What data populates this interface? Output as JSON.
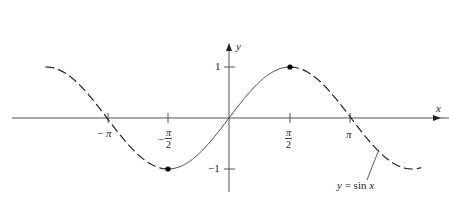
{
  "chart_data": {
    "type": "line",
    "title": "",
    "function": "y = sin x",
    "xlabel": "x",
    "ylabel": "y",
    "x_ticks": [
      {
        "value": -3.14159,
        "label": "−π"
      },
      {
        "value": -1.5708,
        "label": "−π/2"
      },
      {
        "value": 1.5708,
        "label": "π/2"
      },
      {
        "value": 3.14159,
        "label": "π"
      }
    ],
    "y_ticks": [
      {
        "value": 1,
        "label": "1"
      },
      {
        "value": -1,
        "label": "−1"
      }
    ],
    "xlim": [
      -5.9,
      6.2
    ],
    "ylim": [
      -1.6,
      1.6
    ],
    "solid_range": [
      -1.5708,
      1.5708
    ],
    "dashed_ranges": [
      [
        -5.0,
        -1.5708
      ],
      [
        1.5708,
        5.0
      ]
    ],
    "marked_points": [
      {
        "x": -1.5708,
        "y": -1
      },
      {
        "x": 1.5708,
        "y": 1
      }
    ],
    "annotation": "y = sin x",
    "grid": false,
    "legend": "none"
  },
  "labels": {
    "x_axis": "x",
    "y_axis": "y",
    "neg_pi_sign": "−",
    "pi": "π",
    "neg_half_sign": "−",
    "half_num": "π",
    "half_den": "2",
    "y_one": "1",
    "y_neg_one": "−1",
    "curve_label": "y = sin x"
  }
}
